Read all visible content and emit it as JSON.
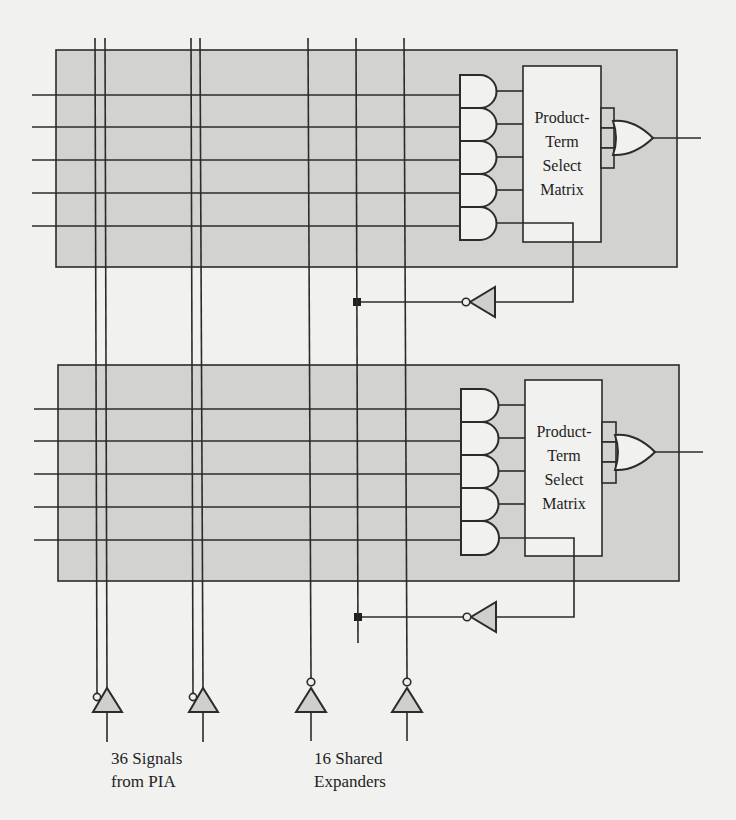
{
  "figure": {
    "type": "logic-schematic",
    "colors": {
      "background": "#f1f1ef",
      "macrocell_fill": "#d2d2d0",
      "line": "#2b2b2b",
      "gate_fill": "#f1f1ef"
    },
    "macrocells": [
      {
        "id": "macrocell-1",
        "and_gates": 5,
        "matrix_label_lines": [
          "Product-",
          "Term",
          "Select",
          "Matrix"
        ],
        "or_gate_inputs": 3,
        "has_output": true,
        "shared_expander_feedback": true
      },
      {
        "id": "macrocell-2",
        "and_gates": 5,
        "matrix_label_lines": [
          "Product-",
          "Term",
          "Select",
          "Matrix"
        ],
        "or_gate_inputs": 3,
        "has_output": true,
        "shared_expander_feedback": true
      }
    ],
    "input_groups": [
      {
        "id": "pia",
        "label_line1": "36 Signals",
        "label_line2": "from PIA",
        "buffers": 2,
        "buffer_type": "true-and-complement"
      },
      {
        "id": "expanders",
        "label_line1": "16 Shared",
        "label_line2": "Expanders",
        "buffers": 2,
        "buffer_type": "inverting"
      }
    ]
  }
}
